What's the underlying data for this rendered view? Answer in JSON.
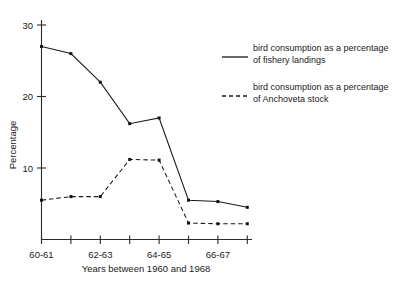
{
  "chart_data": {
    "type": "line",
    "title": "",
    "xlabel": "Years between 1960 and 1968",
    "ylabel": "Percentage",
    "grid": false,
    "legend_position": "right",
    "ylim": [
      0,
      30
    ],
    "yticks": [
      10,
      20,
      30
    ],
    "ytick_labels": [
      "10",
      "20",
      "30"
    ],
    "x": [
      "60-61",
      "61-62",
      "62-63",
      "63-64",
      "64-65",
      "65-66",
      "66-67",
      "67-68"
    ],
    "xtick_labels": [
      "60-61",
      "",
      "62-63",
      "",
      "64-65",
      "",
      "66-67",
      ""
    ],
    "xtick_count": 8,
    "series": [
      {
        "name": "bird consumption as a percentage of fishery landings",
        "style": "solid",
        "values": [
          27.0,
          26.0,
          22.0,
          16.2,
          17.0,
          5.5,
          5.3,
          4.5
        ]
      },
      {
        "name": "bird consumption as a percentage of Anchoveta stock",
        "style": "dashed",
        "values": [
          5.5,
          6.0,
          6.0,
          11.2,
          11.1,
          2.3,
          2.2,
          2.2
        ]
      }
    ]
  },
  "axes": {
    "y_title": "Percentage",
    "x_title": "Years between 1960 and 1968",
    "y_tick_labels": [
      "30",
      "20",
      "10"
    ],
    "x_tick_labels": [
      "60-61",
      "62-63",
      "64-65",
      "66-67"
    ]
  },
  "legend": {
    "entries": [
      {
        "line1": "bird consumption as a percentage",
        "line2": "of fishery landings",
        "style": "solid"
      },
      {
        "line1": "bird consumption as a percentage",
        "line2": "of Anchoveta stock",
        "style": "dashed"
      }
    ]
  },
  "colors": {
    "ink": "#1a1a1a",
    "background": "#ffffff"
  }
}
